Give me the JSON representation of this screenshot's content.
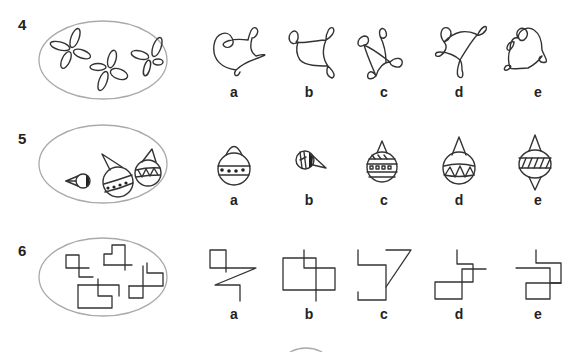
{
  "questions": [
    {
      "number": "4",
      "prompt_shape": "three four-petal loop figures in an oval",
      "options": [
        {
          "label": "a",
          "shape": "looped curve with 4 loops, heart-like"
        },
        {
          "label": "b",
          "shape": "looped curve with 3 loops"
        },
        {
          "label": "c",
          "shape": "looped curve with 4 loops, crossing"
        },
        {
          "label": "d",
          "shape": "looped curve with 4 loops, triangular"
        },
        {
          "label": "e",
          "shape": "looped curve with 5 loops, round"
        }
      ]
    },
    {
      "number": "5",
      "prompt_shape": "three bauble ornaments in an oval",
      "options": [
        {
          "label": "a",
          "shape": "bauble with dome cap and dotted band"
        },
        {
          "label": "b",
          "shape": "small bauble tilted with striped band"
        },
        {
          "label": "c",
          "shape": "bauble with square-pattern band"
        },
        {
          "label": "d",
          "shape": "bauble with zigzag band"
        },
        {
          "label": "e",
          "shape": "double-pointed bauble with hatched band"
        }
      ]
    },
    {
      "number": "6",
      "prompt_shape": "four rectilinear line figures in an oval",
      "options": [
        {
          "label": "a",
          "shape": "square with zigzag line"
        },
        {
          "label": "b",
          "shape": "overlapping rectangles"
        },
        {
          "label": "c",
          "shape": "open step with triangle"
        },
        {
          "label": "d",
          "shape": "offset squares with cross line"
        },
        {
          "label": "e",
          "shape": "step path with square"
        }
      ]
    }
  ]
}
